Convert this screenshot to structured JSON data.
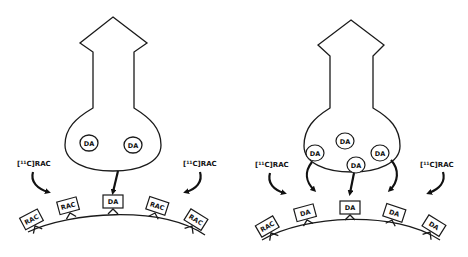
{
  "figure": {
    "panels": [
      {
        "id": "baseline",
        "tracer_labels": [
          "[11C]RAC",
          "[11C]RAC"
        ],
        "vesicles": [
          "DA",
          "DA"
        ],
        "released": [
          "DA"
        ],
        "receptors": [
          "RAC",
          "RAC",
          "DA",
          "RAC",
          "RAC"
        ]
      },
      {
        "id": "stimulated",
        "tracer_labels": [
          "[11C]RAC",
          "[11C]RAC"
        ],
        "vesicles": [
          "DA",
          "DA",
          "DA",
          "DA"
        ],
        "released": [
          "DA",
          "DA",
          "DA"
        ],
        "receptors": [
          "RAC",
          "DA",
          "DA",
          "DA",
          "DA"
        ]
      }
    ],
    "tracer": {
      "bracket_open": "[",
      "superscript": "11",
      "rest": "C]RAC"
    },
    "colors": {
      "line": "#1a1a1a",
      "background": "#ffffff"
    }
  }
}
